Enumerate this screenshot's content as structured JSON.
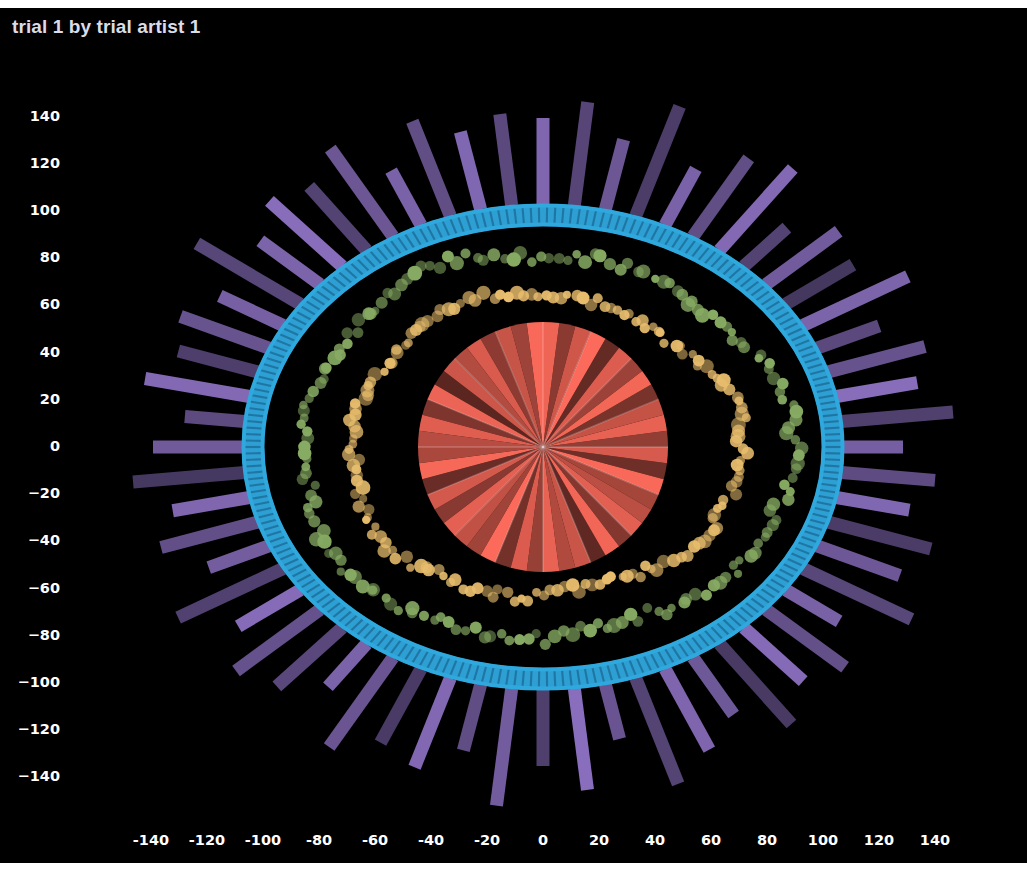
{
  "figure": {
    "title": "trial 1 by trial artist 1",
    "background": "#000000",
    "page_background": "#ffffff",
    "title_color": "#dcdce8",
    "tick_color": "#ffffff",
    "width": 1027,
    "height": 871
  },
  "chart_data": {
    "type": "scatter",
    "title": "trial 1 by trial artist 1",
    "xlabel": "",
    "ylabel": "",
    "xlim": [
      -152,
      152
    ],
    "ylim": [
      -152,
      152
    ],
    "grid": false,
    "legend": null,
    "x_ticks": [
      -140,
      -120,
      -100,
      -80,
      -60,
      -40,
      -20,
      0,
      20,
      40,
      60,
      80,
      100,
      120,
      140
    ],
    "y_ticks": [
      140,
      120,
      100,
      80,
      60,
      40,
      20,
      0,
      -20,
      -40,
      -60,
      -80,
      -100,
      -120,
      -140
    ],
    "series": [
      {
        "name": "outer-radial-bars",
        "type": "bar",
        "color": "#8a6fbe",
        "marker": "rectangular-spoke",
        "count": 60,
        "inner_radius_x": 300,
        "inner_radius_y": 243,
        "bar_length_min": 36,
        "bar_length_max": 120,
        "bar_width": 13,
        "alpha_range": [
          0.45,
          1.0
        ],
        "lengths": [
          86,
          104,
          72,
          118,
          64,
          96,
          110,
          58,
          90,
          78,
          116,
          66,
          100,
          82,
          112,
          60,
          94,
          74,
          106,
          88,
          120,
          62,
          98,
          80,
          108,
          70,
          92,
          114,
          56,
          102,
          76,
          118,
          68,
          96,
          84,
          110,
          58,
          88,
          104,
          72,
          116,
          64,
          100,
          78,
          112,
          90,
          60,
          106,
          82,
          94,
          70,
          120,
          74,
          98,
          86,
          108,
          62,
          102,
          80,
          92
        ],
        "alphas": [
          0.92,
          0.62,
          0.78,
          0.55,
          0.88,
          0.7,
          0.95,
          0.6,
          0.82,
          0.5,
          0.9,
          0.66,
          0.74,
          0.98,
          0.58,
          0.85,
          0.68,
          0.93,
          0.54,
          0.79,
          0.64,
          0.87,
          0.72,
          0.96,
          0.52,
          0.8,
          0.91,
          0.61,
          0.76,
          0.99,
          0.57,
          0.83,
          0.69,
          0.94,
          0.53,
          0.77,
          0.89,
          0.65,
          0.73,
          0.97,
          0.59,
          0.84,
          0.71,
          0.92,
          0.51,
          0.81,
          0.67,
          0.95,
          0.56,
          0.75,
          0.86,
          0.63,
          0.9,
          0.98,
          0.6,
          0.78,
          0.88,
          0.7,
          0.93,
          0.66
        ]
      },
      {
        "name": "blue-dash-ring",
        "type": "scatter",
        "color": "#2fa8dd",
        "marker": "vertical-dash",
        "count": 230,
        "radius_x": 290,
        "radius_y": 232,
        "band_thickness": 22,
        "alpha": 0.9
      },
      {
        "name": "green-dot-ring",
        "type": "scatter",
        "color": "#87ab63",
        "marker": "circle",
        "count": 170,
        "radius_x": 245,
        "radius_y": 192,
        "jitter": 13,
        "marker_size_range": [
          8,
          15
        ],
        "alpha_range": [
          0.5,
          1.0
        ]
      },
      {
        "name": "orange-dot-ring",
        "type": "scatter",
        "color": "#e8bd6d",
        "marker": "circle",
        "count": 165,
        "radius_x": 195,
        "radius_y": 150,
        "jitter": 12,
        "marker_size_range": [
          8,
          15
        ],
        "alpha_range": [
          0.5,
          1.0
        ]
      },
      {
        "name": "center-pie-wedges",
        "type": "pie",
        "color": "#fb6a5a",
        "radius": 125,
        "wedge_count": 48,
        "alpha_range": [
          0.35,
          1.0
        ],
        "alphas": [
          0.95,
          0.55,
          0.82,
          1.0,
          0.4,
          0.88,
          0.62,
          0.97,
          0.48,
          0.78,
          0.92,
          0.58,
          0.85,
          0.44,
          0.99,
          0.66,
          0.75,
          0.9,
          0.52,
          0.96,
          0.38,
          0.8,
          0.7,
          0.93,
          0.6,
          0.87,
          0.46,
          1.0,
          0.64,
          0.77,
          0.91,
          0.54,
          0.84,
          0.42,
          0.98,
          0.68,
          0.73,
          0.89,
          0.5,
          0.94,
          0.36,
          0.81,
          0.71,
          0.86,
          0.56,
          0.79,
          0.63,
          0.99
        ]
      }
    ]
  },
  "axes": {
    "y_labels": [
      "140",
      "120",
      "100",
      "80",
      "60",
      "40",
      "20",
      "0",
      "−20",
      "−40",
      "−60",
      "−80",
      "−100",
      "−120",
      "−140"
    ],
    "x_labels": [
      "-140",
      "-120",
      "-100",
      "-80",
      "-60",
      "-40",
      "-20",
      "0",
      "20",
      "40",
      "60",
      "80",
      "100",
      "120",
      "140"
    ]
  }
}
